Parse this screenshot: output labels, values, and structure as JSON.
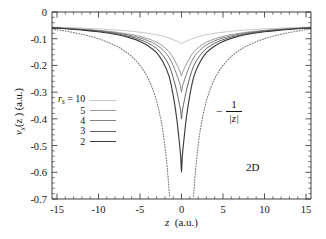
{
  "figure": {
    "panel_label": "2D",
    "asymptote_annotation": {
      "minus": "−",
      "numerator": "1",
      "denominator": "|z|",
      "full_text": "-1/|z|"
    }
  },
  "axes": {
    "x_title_var": "z",
    "x_title_units": "(a.u.)",
    "y_title_var": "v",
    "y_title_sub": "x",
    "y_title_arg": "(z )",
    "y_title_units": "(a.u.)",
    "x_ticks": [
      "-15",
      "-10",
      "-5",
      "0",
      "5",
      "10",
      "15"
    ],
    "y_ticks": [
      "0",
      "-0.1",
      "-0.2",
      "-0.3",
      "-0.4",
      "-0.5",
      "-0.6",
      "-0.7"
    ]
  },
  "legend": {
    "title_var": "r",
    "title_sub": "s",
    "title_eq": "=",
    "entries": [
      {
        "label": "10",
        "color": "#c8c8c8",
        "width": 1.1,
        "dash": "none"
      },
      {
        "label": "5",
        "color": "#9a9a9a",
        "width": 1.1,
        "dash": "none"
      },
      {
        "label": "4",
        "color": "#818181",
        "width": 1.1,
        "dash": "none"
      },
      {
        "label": "3",
        "color": "#5f5f5f",
        "width": 1.1,
        "dash": "none"
      },
      {
        "label": "2",
        "color": "#3c3c3c",
        "width": 1.2,
        "dash": "none"
      }
    ]
  },
  "chart_data": {
    "type": "line",
    "title": "",
    "xlabel": "z  (a.u.)",
    "ylabel": "v_x(z)  (a.u.)",
    "xlim": [
      -15.6,
      15.6
    ],
    "ylim": [
      -0.7,
      0.0
    ],
    "grid": false,
    "legend_position": "center-left",
    "annotations": [
      {
        "text": "2D",
        "x": 9.0,
        "y": -0.52
      },
      {
        "text": "-1/|z|",
        "x": 5.6,
        "y": -0.3
      }
    ],
    "series": [
      {
        "name": "r_s = 10",
        "color": "#c8c8c8",
        "style": "solid",
        "minimum": -0.12,
        "x": [
          -15.6,
          -14,
          -12,
          -10,
          -8,
          -6,
          -5,
          -4,
          -3,
          -2.2,
          -1.5,
          -1.0,
          -0.6,
          -0.3,
          -0.1,
          0,
          0.1,
          0.3,
          0.6,
          1.0,
          1.5,
          2.2,
          3,
          4,
          5,
          6,
          8,
          10,
          12,
          14,
          15.6
        ],
        "y": [
          -0.0565,
          -0.058,
          -0.0603,
          -0.0632,
          -0.067,
          -0.0722,
          -0.0756,
          -0.0798,
          -0.0852,
          -0.0912,
          -0.0977,
          -0.1035,
          -0.1086,
          -0.1128,
          -0.1158,
          -0.12,
          -0.1158,
          -0.1128,
          -0.1086,
          -0.1035,
          -0.0977,
          -0.0912,
          -0.0852,
          -0.0798,
          -0.0756,
          -0.0722,
          -0.067,
          -0.0632,
          -0.0603,
          -0.058,
          -0.0565
        ]
      },
      {
        "name": "r_s = 5",
        "color": "#9a9a9a",
        "style": "solid",
        "minimum": -0.24,
        "x": [
          -15.6,
          -14,
          -12,
          -10,
          -8,
          -6,
          -5,
          -4,
          -3,
          -2.2,
          -1.5,
          -1.0,
          -0.6,
          -0.3,
          -0.1,
          0,
          0.1,
          0.3,
          0.6,
          1.0,
          1.5,
          2.2,
          3,
          4,
          5,
          6,
          8,
          10,
          12,
          14,
          15.6
        ],
        "y": [
          -0.0585,
          -0.0606,
          -0.0641,
          -0.0687,
          -0.0752,
          -0.0848,
          -0.0916,
          -0.1005,
          -0.113,
          -0.129,
          -0.1487,
          -0.172,
          -0.1945,
          -0.214,
          -0.228,
          -0.24,
          -0.228,
          -0.214,
          -0.1945,
          -0.172,
          -0.1487,
          -0.129,
          -0.113,
          -0.1005,
          -0.0916,
          -0.0848,
          -0.0752,
          -0.0687,
          -0.0641,
          -0.0606,
          -0.0585
        ]
      },
      {
        "name": "r_s = 4",
        "color": "#818181",
        "style": "solid",
        "minimum": -0.3,
        "x": [
          -15.6,
          -14,
          -12,
          -10,
          -8,
          -6,
          -5,
          -4,
          -3,
          -2.2,
          -1.5,
          -1.0,
          -0.6,
          -0.3,
          -0.1,
          0,
          0.1,
          0.3,
          0.6,
          1.0,
          1.5,
          2.2,
          3,
          4,
          5,
          6,
          8,
          10,
          12,
          14,
          15.6
        ],
        "y": [
          -0.059,
          -0.0613,
          -0.0652,
          -0.0703,
          -0.0777,
          -0.0889,
          -0.097,
          -0.1078,
          -0.1232,
          -0.1435,
          -0.169,
          -0.2005,
          -0.232,
          -0.26,
          -0.28,
          -0.3,
          -0.28,
          -0.26,
          -0.232,
          -0.2005,
          -0.169,
          -0.1435,
          -0.1232,
          -0.1078,
          -0.097,
          -0.0889,
          -0.0777,
          -0.0703,
          -0.0652,
          -0.0613,
          -0.059
        ]
      },
      {
        "name": "r_s = 3",
        "color": "#5f5f5f",
        "style": "solid",
        "minimum": -0.4,
        "x": [
          -15.6,
          -14,
          -12,
          -10,
          -8,
          -6,
          -5,
          -4,
          -3,
          -2.2,
          -1.5,
          -1.0,
          -0.6,
          -0.3,
          -0.1,
          0,
          0.1,
          0.3,
          0.6,
          1.0,
          1.5,
          2.2,
          3,
          4,
          5,
          6,
          8,
          10,
          12,
          14,
          15.6
        ],
        "y": [
          -0.0595,
          -0.062,
          -0.0663,
          -0.072,
          -0.0805,
          -0.0936,
          -0.1035,
          -0.1168,
          -0.1365,
          -0.164,
          -0.1995,
          -0.2455,
          -0.293,
          -0.338,
          -0.37,
          -0.4,
          -0.37,
          -0.338,
          -0.293,
          -0.2455,
          -0.1995,
          -0.164,
          -0.1365,
          -0.1168,
          -0.1035,
          -0.0936,
          -0.0805,
          -0.072,
          -0.0663,
          -0.062,
          -0.0595
        ]
      },
      {
        "name": "r_s = 2",
        "color": "#3c3c3c",
        "style": "solid",
        "minimum": -0.6,
        "x": [
          -15.6,
          -14,
          -12,
          -10,
          -8,
          -6,
          -5,
          -4,
          -3,
          -2.2,
          -1.5,
          -1.0,
          -0.6,
          -0.3,
          -0.1,
          0,
          0.1,
          0.3,
          0.6,
          1.0,
          1.5,
          2.2,
          3,
          4,
          5,
          6,
          8,
          10,
          12,
          14,
          15.6
        ],
        "y": [
          -0.06,
          -0.0628,
          -0.0675,
          -0.0738,
          -0.0835,
          -0.0988,
          -0.1105,
          -0.127,
          -0.152,
          -0.189,
          -0.24,
          -0.312,
          -0.393,
          -0.476,
          -0.54,
          -0.6,
          -0.54,
          -0.476,
          -0.393,
          -0.312,
          -0.24,
          -0.189,
          -0.152,
          -0.127,
          -0.1105,
          -0.0988,
          -0.0835,
          -0.0738,
          -0.0675,
          -0.0628,
          -0.06
        ]
      },
      {
        "name": "-1/|z|",
        "color": "#7a7a7a",
        "style": "dotted",
        "x": [
          -15.6,
          -14,
          -12,
          -10,
          -8,
          -7,
          -6,
          -5,
          -4.5,
          -4,
          -3.6,
          -3.2,
          -2.8,
          -2.4,
          -2.1,
          -1.9,
          -1.75,
          -1.63,
          -1.53,
          -1.45,
          1.45,
          1.53,
          1.63,
          1.75,
          1.9,
          2.1,
          2.4,
          2.8,
          3.2,
          3.6,
          4,
          4.5,
          5,
          6,
          7,
          8,
          10,
          12,
          14,
          15.6
        ],
        "y": [
          -0.0641,
          -0.0714,
          -0.0833,
          -0.1,
          -0.125,
          -0.1429,
          -0.1667,
          -0.2,
          -0.2222,
          -0.25,
          -0.2778,
          -0.3125,
          -0.3571,
          -0.4167,
          -0.4762,
          -0.5263,
          -0.5714,
          -0.6135,
          -0.6536,
          -0.6897,
          -0.6897,
          -0.6536,
          -0.6135,
          -0.5714,
          -0.5263,
          -0.4762,
          -0.4167,
          -0.3571,
          -0.3125,
          -0.2778,
          -0.25,
          -0.2222,
          -0.2,
          -0.1667,
          -0.1429,
          -0.125,
          -0.1,
          -0.0833,
          -0.0714,
          -0.0641
        ]
      }
    ]
  }
}
